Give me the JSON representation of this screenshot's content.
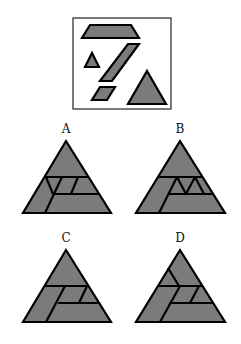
{
  "puzzle": {
    "prompt_panel": {
      "description": "Set of shapes: trapezoid, parallelogram (tall), small triangle, small parallelogram, medium triangle",
      "pieces": [
        "trapezoid",
        "large-parallelogram",
        "small-triangle",
        "small-parallelogram",
        "medium-triangle"
      ]
    },
    "options": [
      {
        "label": "A"
      },
      {
        "label": "B"
      },
      {
        "label": "C"
      },
      {
        "label": "D"
      }
    ],
    "colors": {
      "fill": "#7b7b7b",
      "stroke": "#000000",
      "background": "#ffffff"
    }
  }
}
